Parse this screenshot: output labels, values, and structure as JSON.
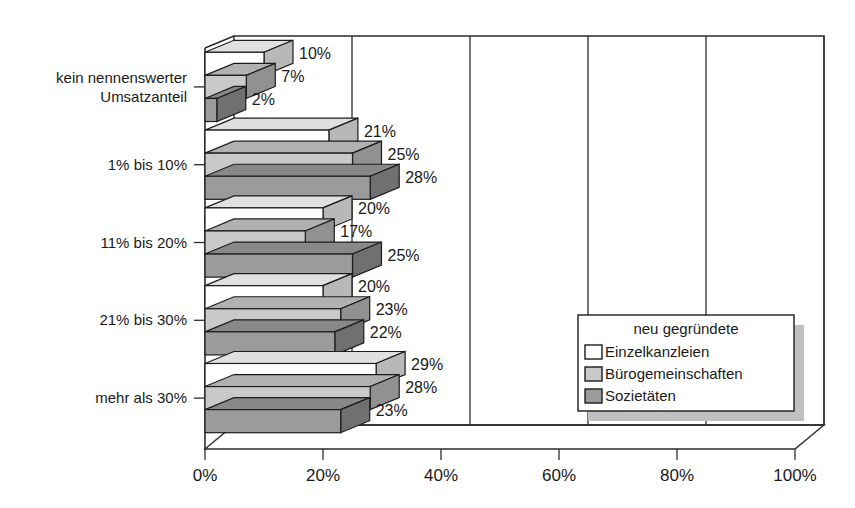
{
  "chart_data": {
    "type": "bar",
    "orientation": "horizontal",
    "style": "3d-grouped-bar",
    "title": "",
    "subtitle": "",
    "xlabel": "",
    "ylabel": "",
    "xlim": [
      0,
      100
    ],
    "xticks": [
      0,
      20,
      40,
      60,
      80,
      100
    ],
    "xtick_labels": [
      "0%",
      "20%",
      "40%",
      "60%",
      "80%",
      "100%"
    ],
    "grid": true,
    "grid_axis": "x",
    "legend_position": "bottom-right",
    "legend_title": "neu gegründete",
    "categories": [
      "kein nennenswerter Umsatzanteil",
      "1% bis 10%",
      "11% bis 20%",
      "21% bis 30%",
      "mehr als 30%"
    ],
    "series": [
      {
        "name": "Einzelkanzleien",
        "color": "#ffffff",
        "values": [
          10,
          21,
          20,
          20,
          29
        ],
        "value_labels": [
          "10%",
          "21%",
          "20%",
          "20%",
          "29%"
        ]
      },
      {
        "name": "Bürogemeinschaften",
        "color": "#c9c9c9",
        "values": [
          7,
          25,
          17,
          23,
          28
        ],
        "value_labels": [
          "7%",
          "25%",
          "17%",
          "23%",
          "28%"
        ]
      },
      {
        "name": "Sozietäten",
        "color": "#9b9b9b",
        "values": [
          2,
          28,
          25,
          22,
          23
        ],
        "value_labels": [
          "2%",
          "28%",
          "25%",
          "22%",
          "23%"
        ]
      }
    ]
  },
  "axis": {
    "x_tick_labels": [
      "0%",
      "20%",
      "40%",
      "60%",
      "80%",
      "100%"
    ],
    "category_labels": [
      {
        "line1": "kein nennenswerter",
        "line2": "Umsatzanteil"
      },
      {
        "line1": "1% bis 10%",
        "line2": ""
      },
      {
        "line1": "11% bis 20%",
        "line2": ""
      },
      {
        "line1": "21% bis 30%",
        "line2": ""
      },
      {
        "line1": "mehr als 30%",
        "line2": ""
      }
    ]
  },
  "legend": {
    "title": "neu gegründete",
    "items": [
      {
        "label": "Einzelkanzleien",
        "color": "#ffffff"
      },
      {
        "label": "Bürogemeinschaften",
        "color": "#c9c9c9"
      },
      {
        "label": "Sozietäten",
        "color": "#9b9b9b"
      }
    ]
  },
  "value_labels_flat": [
    "10%",
    "7%",
    "2%",
    "21%",
    "25%",
    "28%",
    "20%",
    "17%",
    "25%",
    "20%",
    "23%",
    "22%",
    "29%",
    "28%",
    "23%"
  ],
  "colors": {
    "series_front_1": "#ffffff",
    "series_front_2": "#c9c9c9",
    "series_front_3": "#9b9b9b",
    "outline": "#1c1c1c",
    "text": "#1a1a1a",
    "background": "#ffffff",
    "legend_shadow": "#c0c0c0"
  }
}
